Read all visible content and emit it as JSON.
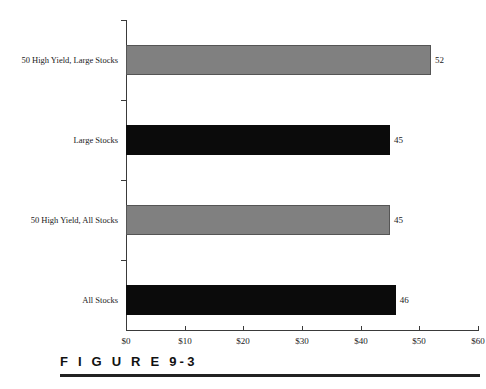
{
  "chart_data": {
    "type": "bar",
    "orientation": "horizontal",
    "title": "",
    "xlabel": "",
    "ylabel": "",
    "xlim": [
      0,
      60
    ],
    "grid": false,
    "legend": "none",
    "categories": [
      "50 High Yield, Large Stocks",
      "Large Stocks",
      "50 High Yield, All Stocks",
      "All Stocks"
    ],
    "values": [
      52,
      45,
      45,
      46
    ],
    "value_labels": [
      "52",
      "45",
      "45",
      "46"
    ],
    "bar_colors": [
      "#808080",
      "#0b0b0b",
      "#808080",
      "#0b0b0b"
    ],
    "bar_color_names": [
      "gray",
      "dark",
      "gray",
      "dark"
    ],
    "xticks": [
      0,
      10,
      20,
      30,
      40,
      50,
      60
    ],
    "xtick_labels": [
      "$0",
      "$10",
      "$20",
      "$30",
      "$40",
      "$50",
      "$60"
    ]
  },
  "figure": {
    "label": "F I G U R E  9-3",
    "caption": ""
  }
}
